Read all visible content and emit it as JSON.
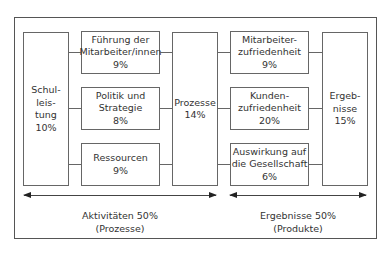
{
  "diagram": {
    "left_column": {
      "label": "Schul-\nleis-\ntung\n10%",
      "name": "Schulleistung",
      "percent": "10%"
    },
    "enablers": [
      {
        "label": "Führung der\nMitarbeiter/innen\n9%",
        "name": "Führung der Mitarbeiter/innen",
        "percent": "9%"
      },
      {
        "label": "Politik und\nStrategie\n8%",
        "name": "Politik und Strategie",
        "percent": "8%"
      },
      {
        "label": "Ressourcen\n9%",
        "name": "Ressourcen",
        "percent": "9%"
      }
    ],
    "center_column": {
      "label": "Prozesse\n14%",
      "name": "Prozesse",
      "percent": "14%"
    },
    "results": [
      {
        "label": "Mitarbeiter-\nzufriedenheit\n9%",
        "name": "Mitarbeiterzufriedenheit",
        "percent": "9%"
      },
      {
        "label": "Kunden-\nzufriedenheit\n20%",
        "name": "Kundenzufriedenheit",
        "percent": "20%"
      },
      {
        "label": "Auswirkung auf\ndie Gesellschaft\n6%",
        "name": "Auswirkung auf die Gesellschaft",
        "percent": "6%"
      }
    ],
    "right_column": {
      "label": "Ergeb-\nnisse\n15%",
      "name": "Ergebnisse",
      "percent": "15%"
    },
    "captions": {
      "left": "Aktivitäten 50%\n(Prozesse)",
      "right": "Ergebnisse 50%\n(Produkte)"
    },
    "colors": {
      "border": "#666666",
      "text": "#333333",
      "background": "#ffffff"
    }
  }
}
